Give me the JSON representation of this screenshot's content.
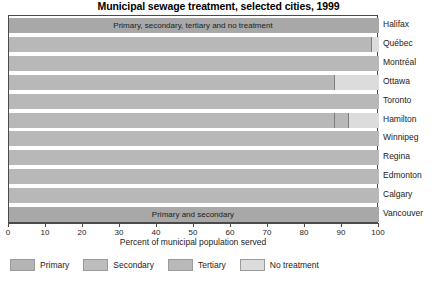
{
  "chart_data": {
    "type": "bar",
    "title": "Municipal sewage treatment, selected cities, 1999",
    "subtitle": "",
    "xlabel": "Percent of municipal population served",
    "ylabel": "",
    "xlim": [
      0,
      100
    ],
    "xticks": [
      0,
      10,
      20,
      30,
      40,
      50,
      60,
      70,
      80,
      90,
      100
    ],
    "xtick_labels": [
      "0",
      "10",
      "20",
      "30",
      "40",
      "50",
      "60",
      "70",
      "80",
      "90",
      "100"
    ],
    "grid": false,
    "orientation": "horizontal",
    "stacked": true,
    "legend_position": "bottom",
    "categories": [
      "Halifax",
      "Québec",
      "Montréal",
      "Ottawa",
      "Toronto",
      "Hamilton",
      "Winnipeg",
      "Regina",
      "Edmonton",
      "Calgary",
      "Vancouver"
    ],
    "series": [
      {
        "name": "Primary",
        "color": "#b4b4b4",
        "values": [
          100,
          98,
          100,
          88,
          100,
          88,
          100,
          100,
          100,
          100,
          100
        ]
      },
      {
        "name": "Secondary",
        "color": "#b4b4b4",
        "values": [
          0,
          0,
          0,
          0,
          0,
          0,
          0,
          0,
          0,
          0,
          0
        ]
      },
      {
        "name": "Tertiary",
        "color": "#bcbcbc",
        "values": [
          0,
          0,
          0,
          0,
          0,
          4,
          0,
          0,
          0,
          0,
          0
        ]
      },
      {
        "name": "No treatment",
        "color": "#dcdcdc",
        "values": [
          0,
          2,
          0,
          12,
          0,
          8,
          0,
          0,
          0,
          0,
          0
        ]
      }
    ],
    "annotations": [
      {
        "category": "Halifax",
        "text": "Primary, secondary, tertiary and no treatment"
      },
      {
        "category": "Vancouver",
        "text": "Primary and secondary"
      }
    ],
    "legend": [
      {
        "label": "Primary",
        "color": "#b4b4b4"
      },
      {
        "label": "Secondary",
        "color": "#bdbdbd"
      },
      {
        "label": "Tertiary",
        "color": "#b9b9b9"
      },
      {
        "label": "No treatment",
        "color": "#dcdcdc"
      }
    ],
    "row_styles": [
      {
        "category": "Halifax",
        "fill": "#a8a8a8"
      },
      {
        "category": "Québec",
        "fill": "#b8b8b8"
      },
      {
        "category": "Montréal",
        "fill": "#b8b8b8"
      },
      {
        "category": "Ottawa",
        "fill": "#b8b8b8"
      },
      {
        "category": "Toronto",
        "fill": "#b8b8b8"
      },
      {
        "category": "Hamilton",
        "fill": "#b8b8b8"
      },
      {
        "category": "Winnipeg",
        "fill": "#b8b8b8"
      },
      {
        "category": "Regina",
        "fill": "#b8b8b8"
      },
      {
        "category": "Edmonton",
        "fill": "#b8b8b8"
      },
      {
        "category": "Calgary",
        "fill": "#b8b8b8"
      },
      {
        "category": "Vancouver",
        "fill": "#a8a8a8"
      }
    ],
    "colors": {
      "frame": "#4a4a4a",
      "axis": "#4a4a4a",
      "text": "#1b1b1b",
      "background": "#ffffff",
      "no_treatment": "#dcdcdc",
      "divider": "#7d7d7d"
    }
  }
}
